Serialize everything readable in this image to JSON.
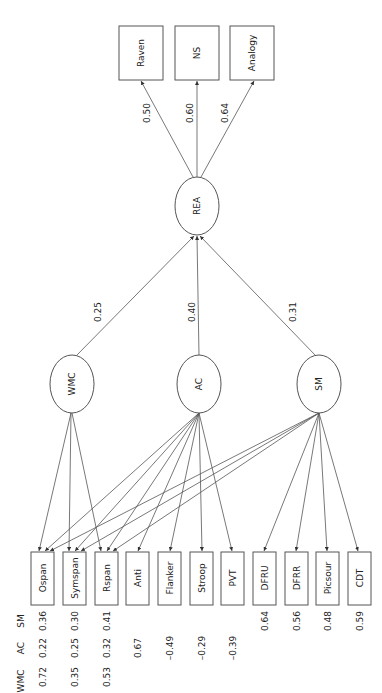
{
  "diagram": {
    "type": "structural-equation-model",
    "orientation": "rotated-90",
    "top_indicators": [
      {
        "label": "Raven",
        "loading": "0.50"
      },
      {
        "label": "NS",
        "loading": "0.60"
      },
      {
        "label": "Analogy",
        "loading": "0.64"
      }
    ],
    "higher_factor": {
      "label": "REA"
    },
    "factors": [
      {
        "label": "WMC",
        "path_to_REA": "0.25"
      },
      {
        "label": "AC",
        "path_to_REA": "0.40"
      },
      {
        "label": "SM",
        "path_to_REA": "0.31"
      }
    ],
    "loadings_header": [
      "WMC",
      "AC",
      "SM"
    ],
    "bottom_indicators": [
      {
        "label": "Ospan",
        "loadings": {
          "WMC": "0.72",
          "AC": "0.22",
          "SM": "0.36"
        }
      },
      {
        "label": "Symspan",
        "loadings": {
          "WMC": "0.35",
          "AC": "0.25",
          "SM": "0.30"
        }
      },
      {
        "label": "Rspan",
        "loadings": {
          "WMC": "0.53",
          "AC": "0.32",
          "SM": "0.41"
        }
      },
      {
        "label": "Anti",
        "loadings": {
          "AC": "0.67"
        }
      },
      {
        "label": "Flanker",
        "loadings": {
          "AC": "–0.49"
        }
      },
      {
        "label": "Stroop",
        "loadings": {
          "AC": "–0.29"
        }
      },
      {
        "label": "PVT",
        "loadings": {
          "AC": "–0.39"
        }
      },
      {
        "label": "DFRU",
        "loadings": {
          "SM": "0.64"
        }
      },
      {
        "label": "DFRR",
        "loadings": {
          "SM": "0.56"
        }
      },
      {
        "label": "Picsour",
        "loadings": {
          "SM": "0.48"
        }
      },
      {
        "label": "CDT",
        "loadings": {
          "SM": "0.59"
        }
      }
    ]
  }
}
